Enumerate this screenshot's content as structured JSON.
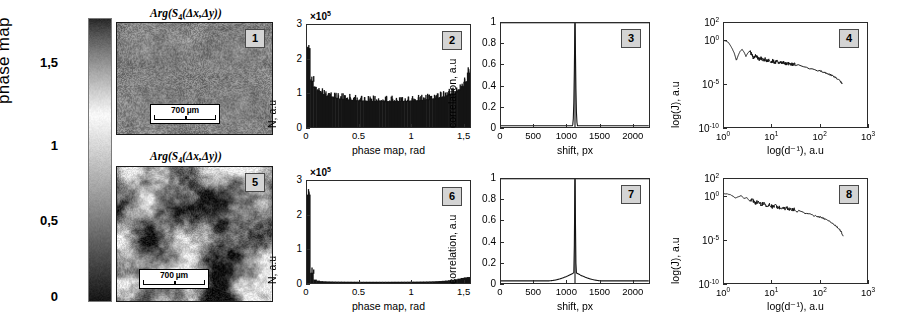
{
  "figure": {
    "colorbar": {
      "axis_title": "phase map",
      "ticks": [
        "1,5",
        "1",
        "0,5",
        "0"
      ],
      "tick_values": [
        1.5,
        1.0,
        0.5,
        0.0
      ],
      "range": [
        0,
        1.5
      ],
      "colormap": "grayscale-phase"
    },
    "micrographs": [
      {
        "badge": "1",
        "title_prefix": "Arg(S",
        "title_sub": "4",
        "title_suffix": "(Δx,Δy))",
        "scalebar_text": "700 µm",
        "texture": "fine-uniform"
      },
      {
        "badge": "5",
        "title_prefix": "Arg(S",
        "title_sub": "4",
        "title_suffix": "(Δx,Δy))",
        "scalebar_text": "700 µm",
        "texture": "coarse-mottled"
      }
    ]
  },
  "chart_data": [
    {
      "id": "panel-2",
      "badge": "2",
      "type": "bar",
      "title": "",
      "xlabel": "phase map, rad",
      "ylabel": "N, a.u",
      "y_multiplier": "×10",
      "y_multiplier_exp": "5",
      "xlim": [
        0,
        1.57
      ],
      "ylim": [
        0,
        3
      ],
      "xticks": [
        0,
        0.5,
        1,
        1.5
      ],
      "xticklabels": [
        "0",
        "0.5",
        "1",
        "1,5"
      ],
      "yticks": [
        0,
        1,
        2,
        3
      ],
      "yticklabels": [
        "0",
        "1",
        "2",
        "3"
      ],
      "grid": false,
      "shape": "u-shaped-bathtub",
      "values": [
        2.32,
        1.36,
        1.18,
        1.08,
        1.02,
        0.97,
        0.93,
        0.9,
        0.88,
        0.86,
        0.84,
        0.83,
        0.82,
        0.81,
        0.8,
        0.79,
        0.785,
        0.78,
        0.775,
        0.772,
        0.77,
        0.768,
        0.766,
        0.765,
        0.764,
        0.763,
        0.763,
        0.764,
        0.765,
        0.767,
        0.769,
        0.772,
        0.776,
        0.78,
        0.785,
        0.79,
        0.8,
        0.81,
        0.82,
        0.83,
        0.845,
        0.86,
        0.88,
        0.9,
        0.93,
        0.96,
        1.0,
        1.05,
        1.11,
        1.2,
        1.34,
        1.6
      ]
    },
    {
      "id": "panel-3",
      "badge": "3",
      "type": "line",
      "title": "",
      "xlabel": "shift, px",
      "ylabel": "correlation, a.u",
      "xlim": [
        0,
        2260
      ],
      "ylim": [
        0,
        1
      ],
      "xticks": [
        0,
        500,
        1000,
        1500,
        2000
      ],
      "xticklabels": [
        "0",
        "500",
        "1000",
        "1500",
        "2000"
      ],
      "yticks": [
        0,
        0.2,
        0.4,
        0.6,
        0.8,
        1
      ],
      "yticklabels": [
        "0",
        "0.2",
        "0.4",
        "0.6",
        "0.8",
        "1"
      ],
      "grid": false,
      "shape": "narrow-delta-spike",
      "peak_x": 1130,
      "peak_y": 1.0,
      "baseline": 0.012,
      "peak_halfwidth": 14
    },
    {
      "id": "panel-4",
      "badge": "4",
      "type": "line",
      "title": "",
      "xlabel": "log(d⁻¹), a.u",
      "ylabel": "log(J), a.u",
      "xscale": "log",
      "yscale": "log",
      "xlim_exp": [
        0,
        3
      ],
      "ylim_exp": [
        -10,
        2
      ],
      "xticklabels": [
        "10",
        "10",
        "10",
        "10"
      ],
      "xtick_exps": [
        "0",
        "1",
        "2",
        "3"
      ],
      "yticklabels": [
        "10",
        "10",
        "10",
        "10"
      ],
      "ytick_exps": [
        "2",
        "0",
        "-5",
        "-10"
      ],
      "grid": false,
      "shape": "decaying-power-law-with-oscillation",
      "x_data_exp": [
        0.0,
        0.05,
        0.1,
        0.14,
        0.18,
        0.22,
        0.26,
        0.3,
        0.34,
        0.38,
        0.42,
        0.46,
        0.5,
        0.54,
        0.58,
        0.62,
        0.66,
        0.7,
        0.74,
        0.78,
        0.82,
        0.86,
        0.9,
        0.94,
        0.98,
        1.02,
        1.06,
        1.1,
        1.14,
        1.18,
        1.22,
        1.26,
        1.3,
        1.34,
        1.38,
        1.42,
        1.46,
        1.5,
        2.02,
        2.1,
        2.18,
        2.26,
        2.34,
        2.42,
        2.48
      ],
      "y_data_exp": [
        -0.05,
        -0.1,
        -0.3,
        -0.65,
        -1.05,
        -1.55,
        -2.3,
        -1.7,
        -1.25,
        -1.05,
        -1.35,
        -1.85,
        -1.45,
        -1.25,
        -1.6,
        -2.05,
        -1.7,
        -1.95,
        -2.25,
        -2.05,
        -2.35,
        -2.15,
        -2.45,
        -2.25,
        -2.5,
        -2.35,
        -2.55,
        -2.45,
        -2.6,
        -2.52,
        -2.65,
        -2.58,
        -2.7,
        -2.64,
        -2.76,
        -2.7,
        -2.82,
        -2.78,
        -3.55,
        -3.7,
        -3.85,
        -4.05,
        -4.3,
        -4.6,
        -5.0
      ]
    },
    {
      "id": "panel-6",
      "badge": "6",
      "type": "bar",
      "title": "",
      "xlabel": "phase map, rad",
      "ylabel": "N, a.u",
      "y_multiplier": "×10",
      "y_multiplier_exp": "5",
      "xlim": [
        0,
        1.57
      ],
      "ylim": [
        0,
        3
      ],
      "xticks": [
        0,
        0.5,
        1,
        1.5
      ],
      "xticklabels": [
        "0",
        "0.5",
        "1",
        "1,5"
      ],
      "yticks": [
        0,
        1,
        2,
        3
      ],
      "yticklabels": [
        "0",
        "1",
        "2",
        "3"
      ],
      "grid": false,
      "shape": "single-spike-at-zero",
      "values": [
        2.6,
        0.3,
        0.1,
        0.07,
        0.055,
        0.05,
        0.046,
        0.044,
        0.042,
        0.041,
        0.04,
        0.039,
        0.038,
        0.038,
        0.037,
        0.037,
        0.036,
        0.036,
        0.036,
        0.036,
        0.036,
        0.036,
        0.036,
        0.036,
        0.036,
        0.036,
        0.036,
        0.037,
        0.037,
        0.037,
        0.038,
        0.038,
        0.039,
        0.039,
        0.04,
        0.041,
        0.042,
        0.043,
        0.045,
        0.047,
        0.05,
        0.054,
        0.058,
        0.064,
        0.072,
        0.082,
        0.095,
        0.11,
        0.128,
        0.148,
        0.165,
        0.175
      ]
    },
    {
      "id": "panel-7",
      "badge": "7",
      "type": "line",
      "title": "",
      "xlabel": "shift, px",
      "ylabel": "correlation, a.u",
      "xlim": [
        0,
        2260
      ],
      "ylim": [
        0,
        1
      ],
      "xticks": [
        0,
        500,
        1000,
        1500,
        2000
      ],
      "xticklabels": [
        "0",
        "500",
        "1000",
        "1500",
        "2000"
      ],
      "yticks": [
        0,
        0.2,
        0.4,
        0.6,
        0.8,
        1
      ],
      "yticklabels": [
        "0",
        "0.2",
        "0.4",
        "0.6",
        "0.8",
        "1"
      ],
      "grid": false,
      "shape": "spike-with-broad-tent-base",
      "peak_x": 1130,
      "peak_y": 1.0,
      "baseline": 0.02,
      "peak_halfwidth": 10,
      "tent_halfwidth": 430,
      "tent_height": 0.085
    },
    {
      "id": "panel-8",
      "badge": "8",
      "type": "line",
      "title": "",
      "xlabel": "log(d⁻¹), a.u",
      "ylabel": "log(J), a.u",
      "xscale": "log",
      "yscale": "log",
      "xlim_exp": [
        0,
        3
      ],
      "ylim_exp": [
        -10,
        2
      ],
      "xticklabels": [
        "10",
        "10",
        "10",
        "10"
      ],
      "xtick_exps": [
        "0",
        "1",
        "2",
        "3"
      ],
      "yticklabels": [
        "10",
        "10",
        "10",
        "10"
      ],
      "ytick_exps": [
        "2",
        "0",
        "-5",
        "-10"
      ],
      "grid": false,
      "shape": "oscillating-power-law-steep-tail",
      "x_data_exp": [
        0.0,
        0.06,
        0.12,
        0.18,
        0.24,
        0.3,
        0.36,
        0.42,
        0.48,
        0.54,
        0.6,
        0.66,
        0.72,
        0.78,
        0.84,
        0.9,
        0.96,
        1.02,
        1.08,
        1.14,
        1.2,
        1.26,
        1.32,
        1.38,
        1.44,
        1.5,
        1.8,
        1.95,
        2.05,
        2.15,
        2.25,
        2.35,
        2.45,
        2.5
      ],
      "y_data_exp": [
        0.3,
        0.28,
        0.22,
        0.05,
        -0.2,
        -0.05,
        0.08,
        -0.25,
        -0.15,
        -0.55,
        -0.4,
        -0.75,
        -0.6,
        -0.95,
        -0.8,
        -1.1,
        -0.95,
        -1.25,
        -1.1,
        -1.35,
        -1.25,
        -1.45,
        -1.35,
        -1.55,
        -1.45,
        -1.6,
        -2.1,
        -2.3,
        -2.45,
        -2.7,
        -3.0,
        -3.4,
        -4.0,
        -4.6
      ]
    }
  ]
}
